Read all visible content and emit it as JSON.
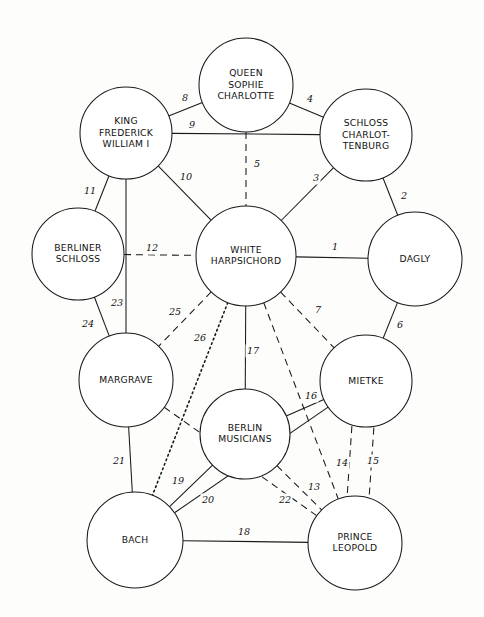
{
  "diagram": {
    "type": "node-link-network",
    "canvas": {
      "width": 484,
      "height": 617
    },
    "style": {
      "background": "#fdfdfc",
      "stroke": "#1a1a1a",
      "node_fill": "#ffffff",
      "label_color": "#111111"
    },
    "nodes": [
      {
        "id": "queen-sophie-charlotte",
        "lines": [
          "QUEEN",
          "SOPHIE",
          "CHARLOTTE"
        ],
        "cx": 246,
        "cy": 85,
        "r": 47
      },
      {
        "id": "king-frederick-william-i",
        "lines": [
          "KING",
          "FREDERICK",
          "WILLIAM I"
        ],
        "cx": 126,
        "cy": 133,
        "r": 46
      },
      {
        "id": "schloss-charlottenburg",
        "lines": [
          "SCHLOSS",
          "CHARLOT-",
          "TENBURG"
        ],
        "cx": 366,
        "cy": 135,
        "r": 46
      },
      {
        "id": "berliner-schloss",
        "lines": [
          "BERLINER",
          "SCHLOSS"
        ],
        "cx": 78,
        "cy": 254,
        "r": 46
      },
      {
        "id": "white-harpsichord",
        "lines": [
          "WHITE",
          "HARPSICHORD"
        ],
        "cx": 246,
        "cy": 256,
        "r": 50
      },
      {
        "id": "dagly",
        "lines": [
          "DAGLY"
        ],
        "cx": 415,
        "cy": 259,
        "r": 47
      },
      {
        "id": "margrave",
        "lines": [
          "MARGRAVE"
        ],
        "cx": 126,
        "cy": 380,
        "r": 47
      },
      {
        "id": "mietke",
        "lines": [
          "MIETKE"
        ],
        "cx": 366,
        "cy": 381,
        "r": 46
      },
      {
        "id": "berlin-musicians",
        "lines": [
          "BERLIN",
          "MUSICIANS"
        ],
        "cx": 245,
        "cy": 434,
        "r": 45
      },
      {
        "id": "bach",
        "lines": [
          "BACH"
        ],
        "cx": 135,
        "cy": 540,
        "r": 48
      },
      {
        "id": "prince-leopold",
        "lines": [
          "PRINCE",
          "LEOPOLD"
        ],
        "cx": 355,
        "cy": 543,
        "r": 47
      }
    ],
    "edges": [
      {
        "label": "1",
        "from": "white-harpsichord",
        "to": "dagly",
        "style": "solid",
        "lx": 335,
        "ly": 247
      },
      {
        "label": "2",
        "from": "schloss-charlottenburg",
        "to": "dagly",
        "style": "solid",
        "lx": 404,
        "ly": 196
      },
      {
        "label": "3",
        "from": "schloss-charlottenburg",
        "to": "white-harpsichord",
        "style": "solid",
        "lx": 316,
        "ly": 178
      },
      {
        "label": "4",
        "from": "queen-sophie-charlotte",
        "to": "schloss-charlottenburg",
        "style": "solid",
        "lx": 310,
        "ly": 99
      },
      {
        "label": "5",
        "from": "queen-sophie-charlotte",
        "to": "white-harpsichord",
        "style": "dashed",
        "lx": 257,
        "ly": 164
      },
      {
        "label": "6",
        "from": "dagly",
        "to": "mietke",
        "style": "solid",
        "lx": 400,
        "ly": 325
      },
      {
        "label": "7",
        "from": "white-harpsichord",
        "to": "mietke",
        "style": "dashed",
        "lx": 318,
        "ly": 310
      },
      {
        "label": "8",
        "from": "king-frederick-william-i",
        "to": "queen-sophie-charlotte",
        "style": "solid",
        "lx": 185,
        "ly": 98
      },
      {
        "label": "9",
        "from": "king-frederick-william-i",
        "to": "schloss-charlottenburg",
        "style": "solid",
        "lx": 192,
        "ly": 125
      },
      {
        "label": "10",
        "from": "king-frederick-william-i",
        "to": "white-harpsichord",
        "style": "solid",
        "lx": 186,
        "ly": 177
      },
      {
        "label": "11",
        "from": "king-frederick-william-i",
        "to": "berliner-schloss",
        "style": "solid",
        "lx": 90,
        "ly": 191
      },
      {
        "label": "12",
        "from": "berliner-schloss",
        "to": "white-harpsichord",
        "style": "dashed",
        "lx": 152,
        "ly": 248
      },
      {
        "label": "13",
        "from": "white-harpsichord",
        "to": "prince-leopold",
        "style": "dashed",
        "lx": 314,
        "ly": 487
      },
      {
        "label": "14",
        "from": "mietke",
        "to": "prince-leopold",
        "style": "dashed",
        "lx": 342,
        "ly": 463
      },
      {
        "label": "15",
        "from": "mietke",
        "to": "prince-leopold",
        "style": "dashed",
        "lx": 373,
        "ly": 461
      },
      {
        "label": "16",
        "from": "berlin-musicians",
        "to": "mietke",
        "style": "solid",
        "lx": 311,
        "ly": 396
      },
      {
        "label": "17",
        "from": "white-harpsichord",
        "to": "berlin-musicians",
        "style": "solid",
        "lx": 253,
        "ly": 351
      },
      {
        "label": "18",
        "from": "bach",
        "to": "prince-leopold",
        "style": "solid",
        "lx": 244,
        "ly": 532
      },
      {
        "label": "19",
        "from": "bach",
        "to": "berlin-musicians",
        "style": "solid",
        "lx": 178,
        "ly": 481
      },
      {
        "label": "20",
        "from": "bach",
        "to": "mietke",
        "style": "solid",
        "lx": 208,
        "ly": 500
      },
      {
        "label": "21",
        "from": "margrave",
        "to": "bach",
        "style": "solid",
        "lx": 119,
        "ly": 461
      },
      {
        "label": "22",
        "from": "berlin-musicians",
        "to": "prince-leopold",
        "style": "dashed",
        "lx": 285,
        "ly": 500
      },
      {
        "label": "23",
        "from": "king-frederick-william-i",
        "to": "margrave",
        "style": "solid",
        "lx": 117,
        "ly": 303
      },
      {
        "label": "24",
        "from": "berliner-schloss",
        "to": "margrave",
        "style": "solid",
        "lx": 88,
        "ly": 324
      },
      {
        "label": "25",
        "from": "white-harpsichord",
        "to": "margrave",
        "style": "dashed",
        "lx": 175,
        "ly": 312
      },
      {
        "label": "26",
        "from": "white-harpsichord",
        "to": "bach",
        "style": "dotted",
        "lx": 200,
        "ly": 338
      }
    ],
    "extra_edges": [
      {
        "id": "margrave-prince-leopold",
        "from": "margrave",
        "to": "prince-leopold",
        "style": "dashed"
      }
    ]
  }
}
